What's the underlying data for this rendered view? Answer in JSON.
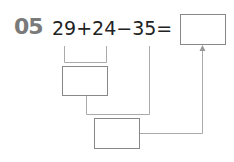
{
  "problem": {
    "number": "05",
    "expression": "29+24−35=",
    "answer_box": "",
    "step1_box": "",
    "step2_box": ""
  },
  "colors": {
    "number": "#7a7a7a",
    "text": "#222222",
    "lines": "#aaaaaa"
  }
}
